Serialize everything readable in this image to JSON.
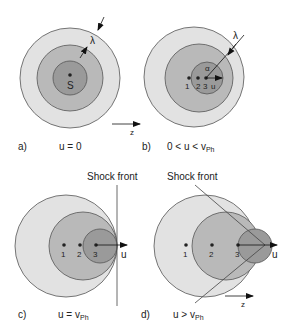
{
  "colors": {
    "outer_fill": "#e2e2e2",
    "middle_fill": "#b9b9b9",
    "inner_fill": "#9a9a9a",
    "stroke": "#555555",
    "dot": "#222222"
  },
  "panels": [
    {
      "id": "a",
      "label": "a)",
      "condition": "u = 0",
      "source_label": "S",
      "wavelength_label": "λ",
      "axis_label": "z"
    },
    {
      "id": "b",
      "label": "b)",
      "condition_prefix": "0 < u < v",
      "condition_sub": "Ph",
      "points": [
        "1",
        "2",
        "3"
      ],
      "velocity_label": "u",
      "angle_label": "α",
      "wavelength_label": "λ"
    },
    {
      "id": "c",
      "label": "c)",
      "condition_prefix": "u = v",
      "condition_sub": "Ph",
      "points": [
        "1",
        "2",
        "3"
      ],
      "velocity_label": "u",
      "shock_label": "Shock front"
    },
    {
      "id": "d",
      "label": "d)",
      "condition_prefix": "u > v",
      "condition_sub": "Ph",
      "points": [
        "1",
        "2",
        "3"
      ],
      "velocity_label": "u",
      "shock_label": "Shock front",
      "axis_label": "z"
    }
  ]
}
